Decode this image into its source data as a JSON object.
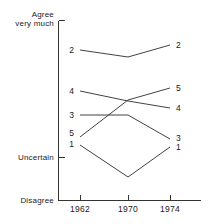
{
  "chart_data": {
    "type": "line",
    "title": "",
    "xlabel": "",
    "ylabel": "",
    "x": [
      1962,
      1970,
      1974
    ],
    "categories": [
      "1962",
      "1970",
      "1974"
    ],
    "grid": false,
    "legend_position": "inline-endpoints",
    "y_axis": {
      "top_label_line1": "Agree",
      "top_label_line2": "very much",
      "middle_label": "Uncertain",
      "bottom_label": "Disagree",
      "ticks": [
        "Agree very much",
        "Uncertain",
        "Disagree"
      ],
      "range_description": "Agree very much (top) to Disagree (bottom)"
    },
    "x_axis": {
      "ticks": [
        "1962",
        "1970",
        "1974"
      ]
    },
    "series": [
      {
        "name": "2",
        "left_label": "2",
        "right_label": "2",
        "values": [
          0.834,
          0.794,
          0.861
        ],
        "points_px": [
          [
            80,
            50
          ],
          [
            128,
            57
          ],
          [
            170,
            45
          ]
        ]
      },
      {
        "name": "4",
        "left_label": "4",
        "right_label": "4",
        "values": [
          0.606,
          0.55,
          0.511
        ],
        "points_px": [
          [
            80,
            91
          ],
          [
            128,
            101
          ],
          [
            170,
            108
          ]
        ]
      },
      {
        "name": "5",
        "left_label": "5",
        "right_label": "5",
        "values": [
          0.35,
          0.556,
          0.622
        ],
        "points_px": [
          [
            80,
            137
          ],
          [
            128,
            100
          ],
          [
            170,
            88
          ]
        ]
      },
      {
        "name": "3",
        "left_label": "3",
        "right_label": "3",
        "values": [
          0.472,
          0.472,
          0.339
        ],
        "points_px": [
          [
            80,
            115
          ],
          [
            128,
            115
          ],
          [
            170,
            139
          ]
        ]
      },
      {
        "name": "1",
        "left_label": "1",
        "right_label": "1",
        "values": [
          0.306,
          0.128,
          0.294
        ],
        "points_px": [
          [
            80,
            145
          ],
          [
            128,
            177
          ],
          [
            170,
            147
          ]
        ]
      }
    ]
  }
}
